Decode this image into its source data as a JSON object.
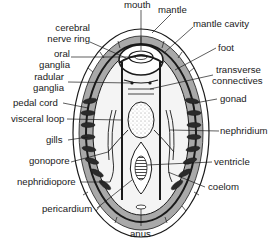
{
  "diagram": {
    "labels": {
      "mouth": "mouth",
      "mantle": "mantle",
      "mantle_cavity": "mantle cavity",
      "cerebral_nerve_ring_1": "cerebral",
      "cerebral_nerve_ring_2": "nerve ring",
      "oral_ganglia_1": "oral",
      "oral_ganglia_2": "ganglia",
      "foot": "foot",
      "transverse_connectives_1": "transverse",
      "transverse_connectives_2": "connectives",
      "radular_ganglia_1": "radular",
      "radular_ganglia_2": "ganglia",
      "pedal_cord": "pedal cord",
      "gonad": "gonad",
      "visceral_loop": "visceral loop",
      "gills": "gills",
      "nephridium": "nephridium",
      "gonopore": "gonopore",
      "ventricle": "ventricle",
      "nephridiopore": "nephridiopore",
      "coelom": "coelom",
      "pericardium": "pericardium",
      "anus": "anus"
    },
    "colors": {
      "mantle_groove": "#a9a9a9",
      "outline": "#1a1a1a",
      "background": "#ffffff"
    }
  }
}
